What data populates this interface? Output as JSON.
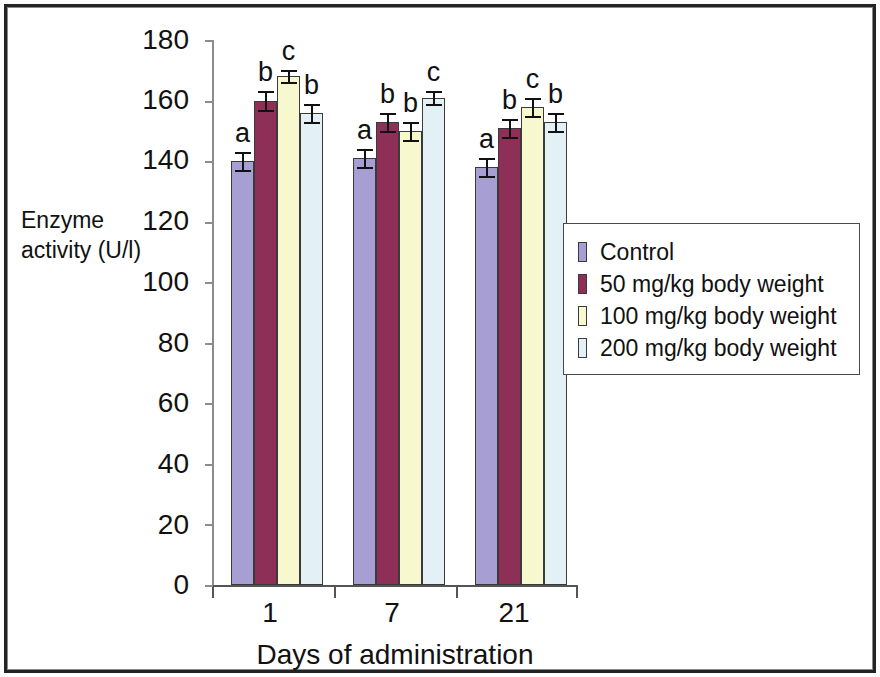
{
  "chart_data": {
    "type": "bar",
    "title": "",
    "xlabel": "Days of administration",
    "ylabel": "Enzyme\nactivity (U/l)",
    "categories": [
      "1",
      "7",
      "21"
    ],
    "ylim": [
      0,
      180
    ],
    "yticks": [
      0,
      20,
      40,
      60,
      80,
      100,
      120,
      140,
      160,
      180
    ],
    "grid": false,
    "legend_position": "right",
    "series": [
      {
        "name": "Control",
        "color": "#a79ed4",
        "values": [
          140,
          141,
          138
        ],
        "errors": [
          3,
          3,
          3
        ],
        "letters": [
          "a",
          "a",
          "a"
        ]
      },
      {
        "name": "50 mg/kg body weight",
        "color": "#8e2f58",
        "values": [
          160,
          153,
          151
        ],
        "errors": [
          3,
          3,
          3
        ],
        "letters": [
          "b",
          "b",
          "b"
        ]
      },
      {
        "name": "100 mg/kg body weight",
        "color": "#f8f8cf",
        "values": [
          168,
          150,
          158
        ],
        "errors": [
          2,
          3,
          3
        ],
        "letters": [
          "c",
          "b",
          "c"
        ]
      },
      {
        "name": "200 mg/kg body weight",
        "color": "#e3f0f5",
        "values": [
          156,
          161,
          153
        ],
        "errors": [
          3,
          2,
          3
        ],
        "letters": [
          "b",
          "c",
          "b"
        ]
      }
    ]
  },
  "legend": {
    "entries": [
      "Control",
      "50 mg/kg body weight",
      "100 mg/kg body weight",
      "200 mg/kg body weight"
    ]
  },
  "axis": {
    "y_tick_labels": [
      "180",
      "160",
      "140",
      "120",
      "100",
      "80",
      "60",
      "40",
      "20",
      "0"
    ],
    "x_tick_labels": [
      "1",
      "7",
      "21"
    ]
  }
}
